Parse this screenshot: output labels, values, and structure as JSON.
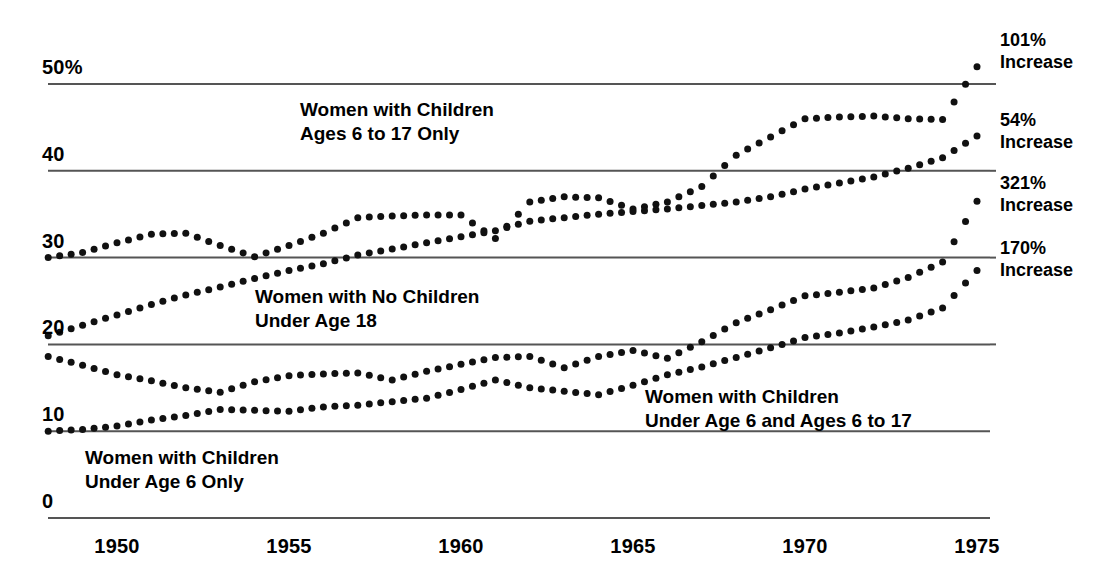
{
  "chart_data": {
    "type": "scatter",
    "title": "",
    "subtitle": "",
    "xlabel": "",
    "ylabel": "",
    "xlim": [
      1947.5,
      1975.5
    ],
    "ylim": [
      0,
      53
    ],
    "grid": true,
    "gridlines_y": [
      0,
      10,
      20,
      30,
      40,
      50
    ],
    "legend_position": "inline-annotations",
    "x_ticks": [
      "1950",
      "1955",
      "1960",
      "1965",
      "1970",
      "1975"
    ],
    "x_tick_values": [
      1950,
      1955,
      1960,
      1965,
      1970,
      1975
    ],
    "y_ticks": [
      "0",
      "10",
      "20",
      "30",
      "40",
      "50%"
    ],
    "y_tick_values": [
      0,
      10,
      20,
      30,
      40,
      50
    ],
    "marker": "dot",
    "marker_color": "#111111",
    "gridline_color": "#555555",
    "x": [
      1948,
      1949,
      1950,
      1951,
      1952,
      1953,
      1954,
      1955,
      1956,
      1957,
      1958,
      1959,
      1960,
      1961,
      1962,
      1963,
      1964,
      1965,
      1966,
      1967,
      1968,
      1969,
      1970,
      1971,
      1972,
      1973,
      1974,
      1975
    ],
    "series": [
      {
        "name": "Women with Children Ages 6 to 17 Only",
        "label_lines": [
          "Women with Children",
          "Ages 6 to 17 Only"
        ],
        "increase": "101%",
        "values": [
          30.0,
          30.6,
          31.7,
          32.7,
          32.8,
          31.4,
          30.1,
          31.4,
          32.8,
          34.6,
          34.8,
          34.9,
          34.9,
          32.2,
          36.4,
          37.0,
          36.9,
          35.6,
          36.4,
          38.2,
          41.8,
          43.9,
          46.0,
          46.2,
          46.3,
          46.0,
          45.9,
          52.0
        ]
      },
      {
        "name": "Women with No Children Under Age 18",
        "label_lines": [
          "Women with No Children",
          "Under Age 18"
        ],
        "increase": "54%",
        "values": [
          21.0,
          22.2,
          23.4,
          24.6,
          25.7,
          26.6,
          27.6,
          28.5,
          29.3,
          30.3,
          31.0,
          31.7,
          32.4,
          33.1,
          34.2,
          34.6,
          35.0,
          35.3,
          35.6,
          36.0,
          36.4,
          37.0,
          37.9,
          38.6,
          39.3,
          40.3,
          41.5,
          44.0
        ]
      },
      {
        "name": "Women with Children Under Age 6 and Ages 6 to 17",
        "label_lines": [
          "Women with Children",
          "Under Age 6 and Ages 6 to 17"
        ],
        "increase": "321%",
        "values": [
          18.6,
          17.6,
          16.5,
          15.8,
          15.0,
          14.5,
          15.7,
          16.4,
          16.6,
          16.7,
          15.9,
          16.9,
          17.7,
          18.5,
          18.6,
          17.3,
          18.6,
          19.3,
          18.4,
          20.3,
          22.5,
          24.0,
          25.6,
          26.0,
          26.5,
          27.7,
          29.5,
          36.5
        ]
      },
      {
        "name": "Women with Children Under Age 6 Only",
        "label_lines": [
          "Women with Children",
          "Under Age 6 Only"
        ],
        "increase": "170%",
        "values": [
          10.0,
          10.2,
          10.6,
          11.3,
          11.8,
          12.5,
          12.4,
          12.3,
          12.8,
          13.0,
          13.4,
          13.8,
          14.8,
          15.9,
          15.0,
          14.6,
          14.2,
          15.3,
          16.5,
          17.4,
          18.5,
          19.6,
          20.8,
          21.3,
          22.0,
          22.8,
          24.2,
          28.5
        ]
      }
    ]
  },
  "axis": {
    "y_labels": [
      {
        "text": "50%",
        "value": 50
      },
      {
        "text": "40",
        "value": 40
      },
      {
        "text": "30",
        "value": 30
      },
      {
        "text": "20",
        "value": 20
      },
      {
        "text": "10",
        "value": 10
      },
      {
        "text": "0",
        "value": 0
      }
    ],
    "x_labels": [
      {
        "text": "1950",
        "value": 1950
      },
      {
        "text": "1955",
        "value": 1955
      },
      {
        "text": "1960",
        "value": 1960
      },
      {
        "text": "1965",
        "value": 1965
      },
      {
        "text": "1970",
        "value": 1970
      },
      {
        "text": "1975",
        "value": 1975
      }
    ]
  },
  "right_notes": [
    {
      "percent": "101%",
      "word": "Increase",
      "top": 30
    },
    {
      "percent": "54%",
      "word": "Increase",
      "top": 110
    },
    {
      "percent": "321%",
      "word": "Increase",
      "top": 173
    },
    {
      "percent": "170%",
      "word": "Increase",
      "top": 238
    }
  ],
  "series_labels": [
    {
      "line1": "Women with Children",
      "line2": "Ages 6 to 17 Only",
      "left": 300,
      "top": 98
    },
    {
      "line1": "Women with No Children",
      "line2": "Under Age 18",
      "left": 255,
      "top": 285
    },
    {
      "line1": "Women with Children",
      "line2": "Under Age 6 and Ages 6 to 17",
      "left": 645,
      "top": 385
    },
    {
      "line1": "Women with Children",
      "line2": "Under Age 6 Only",
      "left": 85,
      "top": 446
    }
  ]
}
